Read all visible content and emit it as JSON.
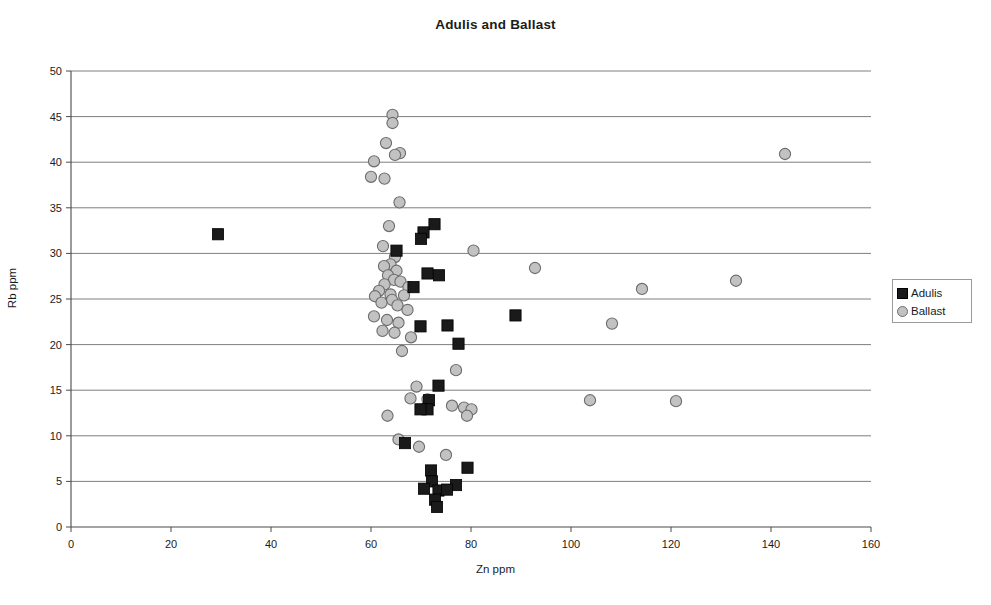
{
  "chart_data": {
    "type": "scatter",
    "title": "Adulis and Ballast",
    "xlabel": "Zn ppm",
    "ylabel": "Rb ppm",
    "xlim": [
      0,
      160
    ],
    "ylim": [
      0,
      50
    ],
    "xticks": [
      0,
      20,
      40,
      60,
      80,
      100,
      120,
      140,
      160
    ],
    "yticks": [
      0,
      5,
      10,
      15,
      20,
      25,
      30,
      35,
      40,
      45,
      50
    ],
    "grid": "horizontal",
    "legend_position": "right",
    "series": [
      {
        "name": "Adulis",
        "marker": "square",
        "color": "#1a1a1a",
        "points": [
          [
            29.4,
            32.1
          ],
          [
            72.7,
            33.2
          ],
          [
            70.5,
            32.3
          ],
          [
            70.0,
            31.6
          ],
          [
            65.1,
            30.3
          ],
          [
            71.3,
            27.8
          ],
          [
            73.6,
            27.6
          ],
          [
            68.5,
            26.3
          ],
          [
            88.9,
            23.2
          ],
          [
            75.3,
            22.1
          ],
          [
            69.9,
            22.0
          ],
          [
            77.5,
            20.1
          ],
          [
            73.5,
            15.5
          ],
          [
            71.6,
            13.9
          ],
          [
            71.3,
            12.9
          ],
          [
            69.9,
            12.9
          ],
          [
            66.8,
            9.2
          ],
          [
            72.0,
            6.2
          ],
          [
            79.3,
            6.5
          ],
          [
            72.2,
            5.0
          ],
          [
            77.0,
            4.6
          ],
          [
            70.6,
            4.2
          ],
          [
            73.5,
            4.0
          ],
          [
            75.2,
            4.1
          ],
          [
            72.8,
            3.0
          ],
          [
            73.2,
            2.2
          ]
        ]
      },
      {
        "name": "Ballast",
        "marker": "circle",
        "color": "#c2c2c2",
        "points": [
          [
            142.8,
            40.9
          ],
          [
            64.3,
            45.2
          ],
          [
            64.3,
            44.3
          ],
          [
            63.0,
            42.1
          ],
          [
            65.8,
            41.0
          ],
          [
            64.8,
            40.8
          ],
          [
            60.6,
            40.1
          ],
          [
            60.0,
            38.4
          ],
          [
            62.7,
            38.2
          ],
          [
            65.7,
            35.6
          ],
          [
            63.6,
            33.0
          ],
          [
            80.5,
            30.3
          ],
          [
            62.4,
            30.8
          ],
          [
            64.8,
            29.6
          ],
          [
            63.9,
            28.8
          ],
          [
            62.6,
            28.6
          ],
          [
            65.1,
            28.1
          ],
          [
            92.8,
            28.4
          ],
          [
            63.4,
            27.6
          ],
          [
            64.6,
            27.1
          ],
          [
            65.9,
            26.9
          ],
          [
            62.7,
            26.6
          ],
          [
            67.5,
            26.3
          ],
          [
            114.2,
            26.1
          ],
          [
            133.0,
            27.0
          ],
          [
            61.6,
            25.9
          ],
          [
            63.9,
            25.5
          ],
          [
            66.6,
            25.4
          ],
          [
            60.8,
            25.3
          ],
          [
            64.2,
            24.9
          ],
          [
            62.1,
            24.6
          ],
          [
            65.3,
            24.3
          ],
          [
            67.3,
            23.8
          ],
          [
            60.6,
            23.1
          ],
          [
            63.2,
            22.7
          ],
          [
            65.5,
            22.4
          ],
          [
            108.2,
            22.3
          ],
          [
            62.3,
            21.5
          ],
          [
            64.7,
            21.3
          ],
          [
            68.0,
            20.8
          ],
          [
            66.2,
            19.3
          ],
          [
            77.0,
            17.2
          ],
          [
            69.1,
            15.4
          ],
          [
            67.9,
            14.1
          ],
          [
            71.3,
            14.0
          ],
          [
            103.8,
            13.9
          ],
          [
            121.0,
            13.8
          ],
          [
            76.2,
            13.3
          ],
          [
            78.6,
            13.1
          ],
          [
            80.1,
            12.9
          ],
          [
            79.2,
            12.2
          ],
          [
            63.3,
            12.2
          ],
          [
            65.5,
            9.6
          ],
          [
            69.6,
            8.8
          ],
          [
            75.0,
            7.9
          ]
        ]
      }
    ]
  },
  "legend": {
    "items": [
      {
        "label": "Adulis"
      },
      {
        "label": "Ballast"
      }
    ]
  }
}
